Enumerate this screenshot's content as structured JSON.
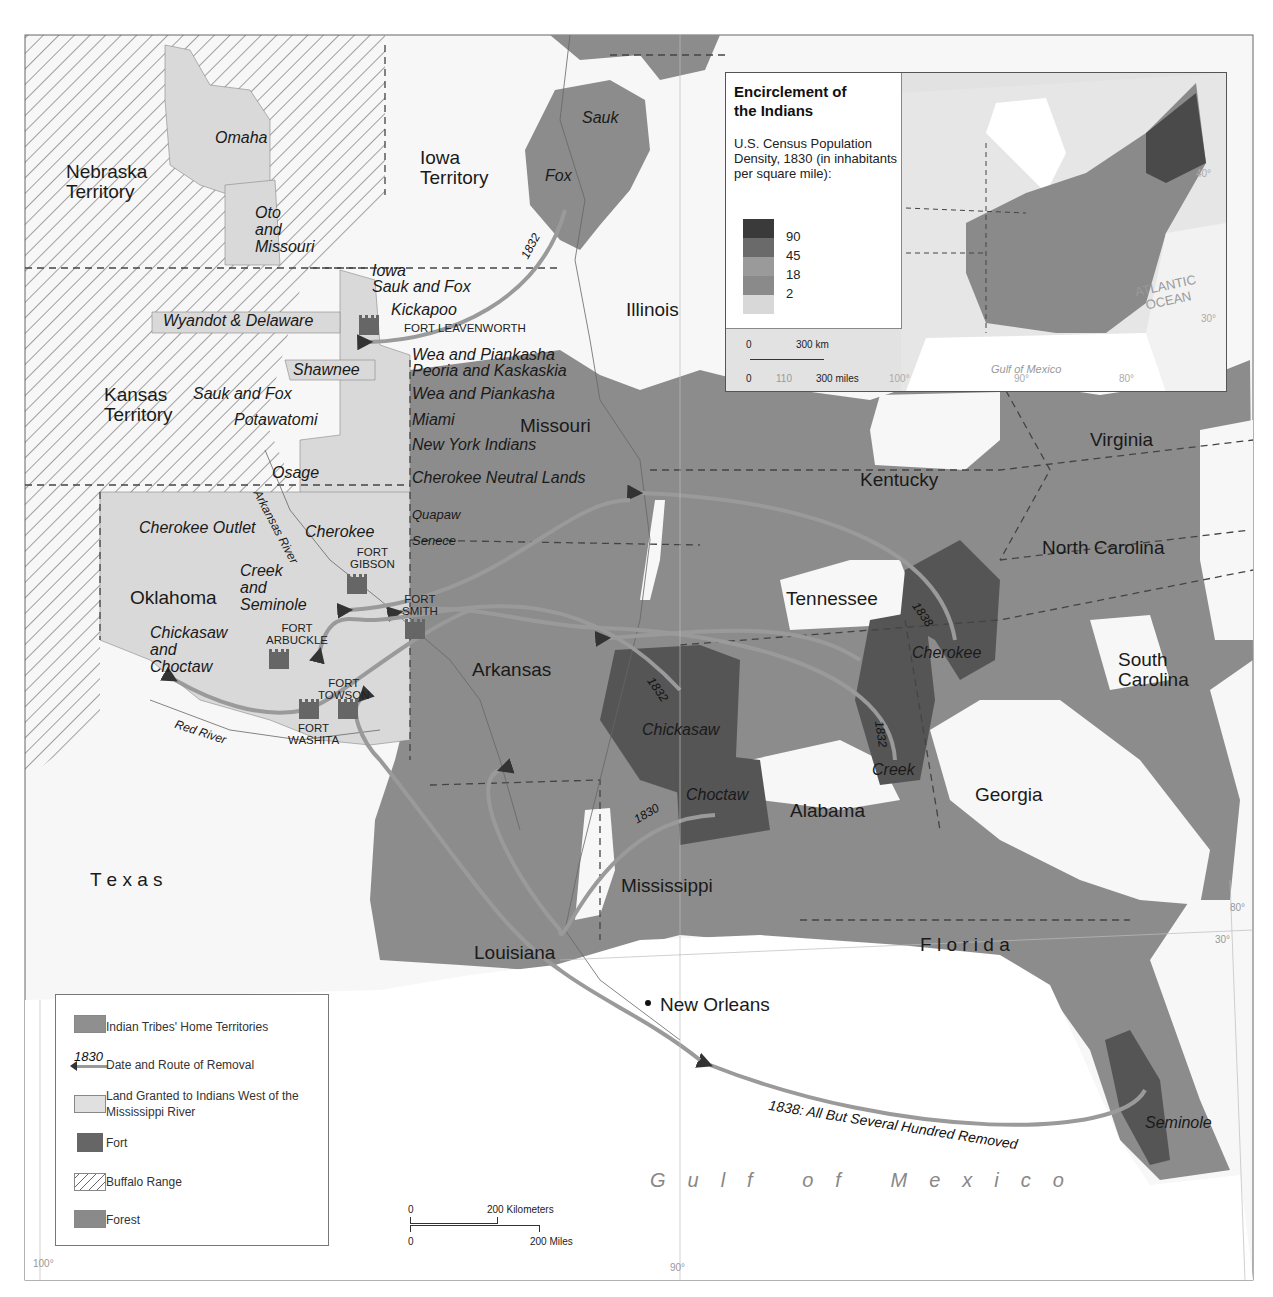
{
  "colors": {
    "forest": "#8c8c8c",
    "homeland": "#555555",
    "granted": "#d9d9d9",
    "route": "#9a9a9a",
    "water_bg": "#ffffff",
    "border": "#444444"
  },
  "states": [
    {
      "label": "Nebraska\nTerritory",
      "x": 66,
      "y": 162
    },
    {
      "label": "Iowa\nTerritory",
      "x": 420,
      "y": 148
    },
    {
      "label": "Illinois",
      "x": 626,
      "y": 300
    },
    {
      "label": "Kansas\nTerritory",
      "x": 104,
      "y": 385
    },
    {
      "label": "Missouri",
      "x": 520,
      "y": 416
    },
    {
      "label": "Kentucky",
      "x": 860,
      "y": 470
    },
    {
      "label": "Virginia",
      "x": 1090,
      "y": 430
    },
    {
      "label": "North Carolina",
      "x": 1042,
      "y": 538
    },
    {
      "label": "Tennessee",
      "x": 786,
      "y": 589
    },
    {
      "label": "South\nCarolina",
      "x": 1118,
      "y": 650
    },
    {
      "label": "Oklahoma",
      "x": 130,
      "y": 588
    },
    {
      "label": "Arkansas",
      "x": 472,
      "y": 660
    },
    {
      "label": "Alabama",
      "x": 790,
      "y": 801
    },
    {
      "label": "Georgia",
      "x": 975,
      "y": 785
    },
    {
      "label": "Mississippi",
      "x": 621,
      "y": 876
    },
    {
      "label": "Louisiana",
      "x": 474,
      "y": 943
    },
    {
      "label": "T e x a s",
      "x": 90,
      "y": 870
    },
    {
      "label": "F l o r i d a",
      "x": 920,
      "y": 935
    }
  ],
  "tribes": [
    {
      "label": "Omaha",
      "x": 215,
      "y": 130
    },
    {
      "label": "Oto\nand\nMissouri",
      "x": 255,
      "y": 205
    },
    {
      "label": "Sauk",
      "x": 582,
      "y": 110
    },
    {
      "label": "Fox",
      "x": 545,
      "y": 168
    },
    {
      "label": "Iowa",
      "x": 372,
      "y": 263
    },
    {
      "label": "Sauk and Fox",
      "x": 372,
      "y": 279
    },
    {
      "label": "Kickapoo",
      "x": 391,
      "y": 302
    },
    {
      "label": "Wyandot & Delaware",
      "x": 163,
      "y": 313
    },
    {
      "label": "Wea and Piankasha",
      "x": 412,
      "y": 347
    },
    {
      "label": "Shawnee",
      "x": 293,
      "y": 362
    },
    {
      "label": "Peoria and Kaskaskia",
      "x": 412,
      "y": 363
    },
    {
      "label": "Sauk and Fox",
      "x": 193,
      "y": 386
    },
    {
      "label": "Wea and Piankasha",
      "x": 412,
      "y": 386
    },
    {
      "label": "Potawatomi",
      "x": 234,
      "y": 412
    },
    {
      "label": "Miami",
      "x": 412,
      "y": 412
    },
    {
      "label": "New York Indians",
      "x": 412,
      "y": 437
    },
    {
      "label": "Osage",
      "x": 272,
      "y": 465
    },
    {
      "label": "Cherokee Neutral Lands",
      "x": 412,
      "y": 470
    },
    {
      "label": "Cherokee Outlet",
      "x": 139,
      "y": 520
    },
    {
      "label": "Cherokee",
      "x": 305,
      "y": 524
    },
    {
      "label": "Creek\nand\nSeminole",
      "x": 240,
      "y": 563
    },
    {
      "label": "Chickasaw\nand\nChoctaw",
      "x": 150,
      "y": 625
    },
    {
      "label": "Chickasaw",
      "x": 642,
      "y": 722
    },
    {
      "label": "Choctaw",
      "x": 686,
      "y": 787
    },
    {
      "label": "Creek",
      "x": 872,
      "y": 762
    },
    {
      "label": "Cherokee",
      "x": 912,
      "y": 645
    },
    {
      "label": "Seminole",
      "x": 1145,
      "y": 1115
    }
  ],
  "tribes_small": [
    {
      "label": "Quapaw",
      "x": 412,
      "y": 508
    },
    {
      "label": "Senece",
      "x": 412,
      "y": 534
    }
  ],
  "rivers": [
    {
      "label": "Arkansas River",
      "x": 262,
      "y": 488,
      "rotate": 62
    },
    {
      "label": "Red River",
      "x": 177,
      "y": 718,
      "rotate": 18
    }
  ],
  "forts": [
    {
      "label": "FORT LEAVENWORTH",
      "x": 382,
      "y": 322,
      "lx": 382,
      "ly": 322,
      "inline": true
    },
    {
      "label": "FORT\nGIBSON",
      "x": 350,
      "y": 576,
      "lx": 350,
      "ly": 546
    },
    {
      "label": "FORT\nSMITH",
      "x": 407,
      "y": 622,
      "lx": 402,
      "ly": 593
    },
    {
      "label": "FORT\nARBUCKLE",
      "x": 269,
      "y": 652,
      "lx": 266,
      "ly": 622
    },
    {
      "label": "FORT\nTOWSON",
      "x": 338,
      "y": 702,
      "lx": 318,
      "ly": 677
    },
    {
      "label": "FORT\nWASHITA",
      "x": 299,
      "y": 702,
      "lx": 288,
      "ly": 722
    }
  ],
  "routes": [
    {
      "year": "1832",
      "x": 519,
      "y": 255,
      "rotate": -62
    },
    {
      "year": "1838",
      "x": 920,
      "y": 600,
      "rotate": 55
    },
    {
      "year": "1832",
      "x": 655,
      "y": 675,
      "rotate": 55
    },
    {
      "year": "1832",
      "x": 885,
      "y": 720,
      "rotate": 82
    },
    {
      "year": "1830",
      "x": 632,
      "y": 815,
      "rotate": -30
    },
    {
      "year": "1838: All But Several Hundred Removed",
      "x": 770,
      "y": 1098,
      "rotate": 9,
      "size": 14
    }
  ],
  "places": [
    {
      "label": "New Orleans",
      "x": 660,
      "y": 995
    }
  ],
  "water": {
    "label": "Gulf of Mexico",
    "x": 650,
    "y": 1170
  },
  "degrees": [
    {
      "label": "100°",
      "x": 33,
      "y": 1259
    },
    {
      "label": "90°",
      "x": 670,
      "y": 1263
    },
    {
      "label": "80°",
      "x": 1230,
      "y": 903
    },
    {
      "label": "30°",
      "x": 1215,
      "y": 935
    }
  ],
  "legend": {
    "items": [
      {
        "label": "Indian Tribes' Home Territories",
        "swatch": "homeland-light"
      },
      {
        "label": "Date and Route of Removal",
        "swatch": "route",
        "sample_year": "1830"
      },
      {
        "label": "Land Granted to Indians West of the Mississippi River",
        "swatch": "granted"
      },
      {
        "label": "Fort",
        "swatch": "fort"
      },
      {
        "label": "Buffalo Range",
        "swatch": "hatch"
      },
      {
        "label": "Forest",
        "swatch": "forest"
      }
    ]
  },
  "scale_bar": {
    "km_zero": "0",
    "km_label": "200 Kilometers",
    "mi_zero": "0",
    "mi_label": "200 Miles"
  },
  "inset": {
    "title": "Encirclement of the Indians",
    "subtitle": "U.S. Census Population Density, 1830 (in inhabitants per square mile):",
    "density_classes": [
      {
        "label": "90",
        "color": "#3a3a3a"
      },
      {
        "label": "45",
        "color": "#6a6a6a"
      },
      {
        "label": "18",
        "color": "#9a9a9a"
      },
      {
        "label": "2",
        "color": "#8a8a8a"
      },
      {
        "label": "",
        "color": "#d8d8d8"
      }
    ],
    "scale": {
      "km_zero": "0",
      "km_label": "300 km",
      "mi_zero": "0",
      "mi_label": "300 miles",
      "mid_tick": "110"
    },
    "labels": {
      "ocean": "ATLANTIC\nOCEAN",
      "gulf": "Gulf of Mexico",
      "deg_40": "40°",
      "deg_30": "30°",
      "deg_100": "100°",
      "deg_90": "90°",
      "deg_80": "80°"
    }
  }
}
